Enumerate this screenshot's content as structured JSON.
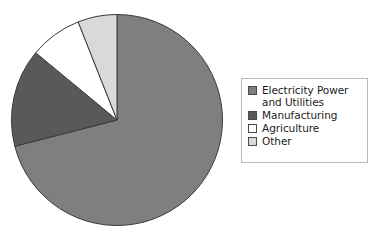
{
  "chart_data": {
    "type": "pie",
    "title": "",
    "categories": [
      "Electricity Power and Utilities",
      "Manufacturing",
      "Agriculture",
      "Other"
    ],
    "values": [
      71,
      15,
      8,
      6
    ],
    "units": "percent",
    "start_angle_deg": 0,
    "direction": "clockwise",
    "legend_position": "right",
    "grid": false,
    "colors": [
      "#7f7f7f",
      "#595959",
      "#ffffff",
      "#d9d9d9"
    ],
    "slices": [
      {
        "label": "Electricity Power and Utilities",
        "value": 71,
        "color": "#7f7f7f"
      },
      {
        "label": "Manufacturing",
        "value": 15,
        "color": "#595959"
      },
      {
        "label": "Agriculture",
        "value": 8,
        "color": "#ffffff"
      },
      {
        "label": "Other",
        "value": 6,
        "color": "#d9d9d9"
      }
    ]
  },
  "legend": {
    "items": [
      {
        "label": "Electricity Power and Utilities",
        "color": "#7f7f7f"
      },
      {
        "label": "Manufacturing",
        "color": "#595959"
      },
      {
        "label": "Agriculture",
        "color": "#ffffff"
      },
      {
        "label": "Other",
        "color": "#d9d9d9"
      }
    ]
  },
  "style": {
    "background": "#ffffff",
    "slice_outline": "#3a3a3a",
    "legend_border": "#b9b9b9",
    "text_color": "#1c1c1c"
  }
}
